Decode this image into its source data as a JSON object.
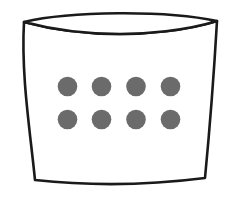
{
  "image": {
    "title": "Container with eight dots",
    "description": "Hand-drawn outline of an open box or basket seen in slight perspective, containing eight filled gray circles arranged in two rows of four.",
    "width": 236,
    "height": 200,
    "background_color": "#ffffff",
    "style": "line-art-sketch"
  },
  "colors": {
    "background": "#ffffff",
    "outline_stroke": "#1a1a1a",
    "container_fill": "#ffffff",
    "dot_fill": "#6b6b6b",
    "dot_stroke": "#6b6b6b"
  },
  "container": {
    "name": "container-outline",
    "label": "Open container",
    "stroke_color": "#1a1a1a",
    "stroke_width": 2.6,
    "fill": "#ffffff",
    "corners": {
      "top_left": [
        24,
        22
      ],
      "top_right": [
        217,
        21
      ],
      "bottom_right": [
        205,
        178
      ],
      "bottom_left": [
        35,
        180
      ]
    },
    "rim": {
      "name": "container-rim",
      "shape": "lens",
      "upper_arc_center_y": 13,
      "lower_arc_center_y": 28,
      "thickness_at_center": 15
    },
    "body": {
      "left_side_bow": 4,
      "right_side_bow": 4,
      "bottom_arc_sag": 7,
      "taper": "narrower-at-bottom"
    }
  },
  "dots": {
    "name": "dot-grid",
    "label": "Eight dots",
    "count": 8,
    "rows": 2,
    "columns": 4,
    "radius": 9.8,
    "fill": "#6b6b6b",
    "row_centers_y": [
      86.5,
      119.5
    ],
    "column_centers_x": [
      67.5,
      101.5,
      136.0,
      170.5
    ],
    "items": [
      {
        "name": "dot-r1-c1",
        "cx": 67.5,
        "cy": 86.5,
        "r": 9.8,
        "row": 1,
        "col": 1
      },
      {
        "name": "dot-r1-c2",
        "cx": 101.5,
        "cy": 86.5,
        "r": 9.8,
        "row": 1,
        "col": 2
      },
      {
        "name": "dot-r1-c3",
        "cx": 136.0,
        "cy": 86.5,
        "r": 9.8,
        "row": 1,
        "col": 3
      },
      {
        "name": "dot-r1-c4",
        "cx": 170.5,
        "cy": 86.5,
        "r": 9.8,
        "row": 1,
        "col": 4
      },
      {
        "name": "dot-r2-c1",
        "cx": 67.5,
        "cy": 119.5,
        "r": 9.8,
        "row": 2,
        "col": 1
      },
      {
        "name": "dot-r2-c2",
        "cx": 101.5,
        "cy": 119.5,
        "r": 9.8,
        "row": 2,
        "col": 2
      },
      {
        "name": "dot-r2-c3",
        "cx": 136.0,
        "cy": 119.5,
        "r": 9.8,
        "row": 2,
        "col": 3
      },
      {
        "name": "dot-r2-c4",
        "cx": 170.5,
        "cy": 119.5,
        "r": 9.8,
        "row": 2,
        "col": 4
      }
    ]
  }
}
